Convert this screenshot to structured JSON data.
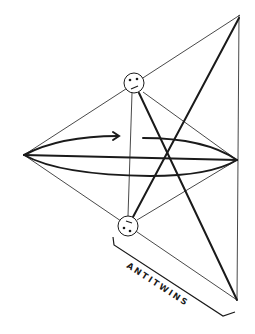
{
  "diagram": {
    "label": "ANTITWINS",
    "colors": {
      "ink": "#1a1a1a",
      "background": "#ffffff"
    },
    "points": {
      "left_apex": [
        24,
        155
      ],
      "top_apex": [
        240,
        15
      ],
      "bottom_apex": [
        237,
        300
      ],
      "right_lens_tip": [
        237,
        160
      ],
      "top_twin": [
        134,
        83
      ],
      "bottom_twin": [
        128,
        226
      ]
    },
    "twins": [
      {
        "name": "top-twin",
        "expression": "frown face"
      },
      {
        "name": "bottom-twin",
        "expression": "upside-down face"
      }
    ]
  }
}
